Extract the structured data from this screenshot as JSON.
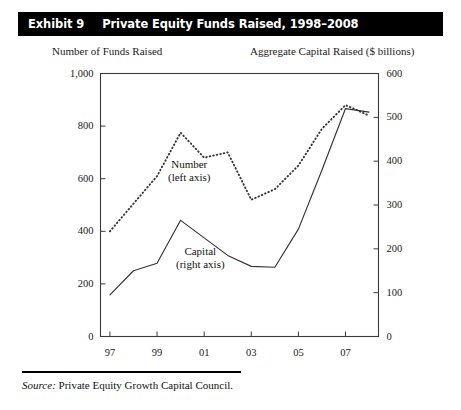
{
  "exhibit": {
    "number": "Exhibit 9",
    "title": "Private Equity Funds Raised, 1998–2008"
  },
  "captions": {
    "left": "Number of Funds Raised",
    "right": "Aggregate Capital Raised ($ billions)"
  },
  "series_labels": {
    "number_line1": "Number",
    "number_line2": "(left axis)",
    "capital_line1": "Capital",
    "capital_line2": "(right axis)"
  },
  "footer": {
    "source_word": "Source:",
    "source_text": " Private Equity Growth Capital Council."
  },
  "axes": {
    "left_ticks": [
      "0",
      "200",
      "400",
      "600",
      "800",
      "1,000"
    ],
    "right_ticks": [
      "0",
      "100",
      "200",
      "300",
      "400",
      "500",
      "600"
    ],
    "x_ticks": [
      "97",
      "99",
      "01",
      "03",
      "05",
      "07"
    ]
  },
  "colors": {
    "title_bar": "#000000",
    "title_text": "#ffffff",
    "axis": "#3a3a3a",
    "line_capital": "#333333",
    "line_number": "#333333",
    "background": "#ffffff"
  },
  "chart_data": {
    "type": "line",
    "title": "Private Equity Funds Raised, 1998–2008",
    "xlabel": "",
    "ylabel": "Number of Funds Raised",
    "y2label": "Aggregate Capital Raised ($ billions)",
    "x": [
      1997,
      1998,
      1999,
      2000,
      2001,
      2002,
      2003,
      2004,
      2005,
      2006,
      2007,
      2008
    ],
    "xtick_labels": [
      "97",
      "99",
      "01",
      "03",
      "05",
      "07"
    ],
    "xtick_values": [
      1997,
      1999,
      2001,
      2003,
      2005,
      2007
    ],
    "xlim": [
      1996.6,
      2008.4
    ],
    "ylim": [
      0,
      1000
    ],
    "y2lim": [
      0,
      600
    ],
    "ytick_values": [
      0,
      200,
      400,
      600,
      800,
      1000
    ],
    "y2tick_values": [
      0,
      100,
      200,
      300,
      400,
      500,
      600
    ],
    "grid": false,
    "legend": "inline-annotations",
    "series": [
      {
        "name": "Number",
        "axis": "left",
        "style": "dotted",
        "annotation": "Number (left axis)",
        "values": [
          400,
          505,
          610,
          775,
          680,
          700,
          520,
          560,
          650,
          790,
          880,
          840
        ]
      },
      {
        "name": "Capital",
        "axis": "right",
        "style": "solid",
        "annotation": "Capital (right axis)",
        "values": [
          95,
          150,
          167,
          265,
          225,
          185,
          160,
          158,
          245,
          380,
          520,
          512
        ]
      }
    ]
  }
}
